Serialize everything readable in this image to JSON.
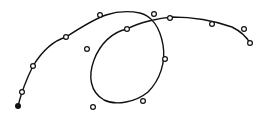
{
  "diagram": {
    "type": "spline-curve-with-control-points",
    "background": "#ffffff",
    "stroke_color": "#111111",
    "curve_path": "M18,106 C20,98 24,84 33,66 C44,48 56,40 66,37 C80,28 92,20 106,15 C118,11 130,11 140,13 C152,16 160,28 163,45 C166,62 160,80 148,92 C136,102 116,106 104,100 C90,92 88,76 94,60 C100,44 112,32 127,29 C140,22 160,18 172,17 C195,17 215,21 232,27 C240,31 246,36 250,43",
    "start_point": {
      "x": 18,
      "y": 106,
      "filled": true
    },
    "control_points": [
      {
        "x": 22,
        "y": 92
      },
      {
        "x": 33,
        "y": 66
      },
      {
        "x": 66,
        "y": 37
      },
      {
        "x": 100,
        "y": 15
      },
      {
        "x": 87,
        "y": 49
      },
      {
        "x": 127,
        "y": 29
      },
      {
        "x": 154,
        "y": 14
      },
      {
        "x": 170,
        "y": 18
      },
      {
        "x": 212,
        "y": 24
      },
      {
        "x": 244,
        "y": 29
      },
      {
        "x": 250,
        "y": 43
      },
      {
        "x": 165,
        "y": 59
      },
      {
        "x": 143,
        "y": 101
      },
      {
        "x": 93,
        "y": 107
      }
    ]
  }
}
